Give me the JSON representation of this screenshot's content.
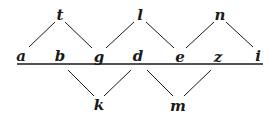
{
  "diagram": {
    "colors": {
      "ink": "#1a1a1a",
      "background": "#ffffff"
    },
    "baseline": {
      "x1": 17,
      "x2": 263,
      "y": 64
    },
    "nodes": [
      {
        "id": "t",
        "label": "t",
        "x": 60,
        "y": 15
      },
      {
        "id": "l",
        "label": "l",
        "x": 140,
        "y": 15
      },
      {
        "id": "n",
        "label": "n",
        "x": 220,
        "y": 15
      },
      {
        "id": "a",
        "label": "a",
        "x": 21,
        "y": 56
      },
      {
        "id": "b",
        "label": "b",
        "x": 60,
        "y": 56
      },
      {
        "id": "g",
        "label": "g",
        "x": 99,
        "y": 57
      },
      {
        "id": "d",
        "label": "d",
        "x": 138,
        "y": 56
      },
      {
        "id": "e",
        "label": "e",
        "x": 180,
        "y": 57
      },
      {
        "id": "z",
        "label": "z",
        "x": 218,
        "y": 57
      },
      {
        "id": "i",
        "label": "i",
        "x": 258,
        "y": 56
      },
      {
        "id": "k",
        "label": "k",
        "x": 99,
        "y": 105
      },
      {
        "id": "m",
        "label": "m",
        "x": 178,
        "y": 106
      }
    ],
    "edges": [
      {
        "x1": 55,
        "y1": 22,
        "x2": 29,
        "y2": 47
      },
      {
        "x1": 65,
        "y1": 22,
        "x2": 92,
        "y2": 48
      },
      {
        "x1": 134,
        "y1": 22,
        "x2": 106,
        "y2": 48
      },
      {
        "x1": 146,
        "y1": 22,
        "x2": 174,
        "y2": 48
      },
      {
        "x1": 214,
        "y1": 22,
        "x2": 186,
        "y2": 48
      },
      {
        "x1": 226,
        "y1": 22,
        "x2": 253,
        "y2": 47
      },
      {
        "x1": 68,
        "y1": 70,
        "x2": 94,
        "y2": 96
      },
      {
        "x1": 131,
        "y1": 70,
        "x2": 104,
        "y2": 96
      },
      {
        "x1": 147,
        "y1": 70,
        "x2": 173,
        "y2": 96
      },
      {
        "x1": 211,
        "y1": 70,
        "x2": 184,
        "y2": 96
      }
    ]
  }
}
